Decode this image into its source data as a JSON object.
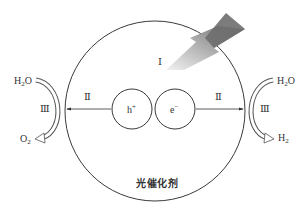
{
  "diagram": {
    "catalyst_label": "光催化剂",
    "stages": {
      "stage_1": "Ⅰ",
      "stage_2_left": "Ⅱ",
      "stage_2_right": "Ⅱ",
      "stage_3_left": "Ⅲ",
      "stage_3_right": "Ⅲ"
    },
    "carriers": {
      "hole": {
        "base": "h",
        "charge": "+"
      },
      "electron": {
        "base": "e",
        "charge": "−"
      }
    },
    "left_reaction": {
      "reactant": {
        "base": "H",
        "sub": "2",
        "tail": "O"
      },
      "product": {
        "base": "O",
        "sub": "2",
        "tail": ""
      }
    },
    "right_reaction": {
      "reactant": {
        "base": "H",
        "sub": "2",
        "tail": "O"
      },
      "product": {
        "base": "H",
        "sub": "2",
        "tail": ""
      }
    },
    "icons": {
      "light": "lightning-bolt-icon"
    },
    "colors": {
      "line": "#3a3a3a",
      "bolt_dark": "#6e6e6e",
      "bolt_light": "#e6e6e6",
      "background": "#ffffff"
    }
  }
}
